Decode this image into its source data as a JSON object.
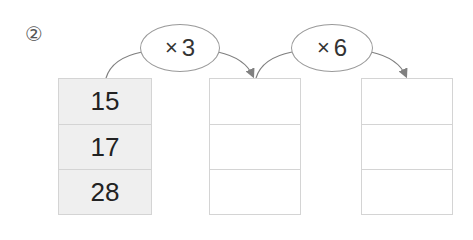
{
  "problem": {
    "number_label": "②"
  },
  "operations": [
    {
      "symbol": "×",
      "operand": "3",
      "label": "×3"
    },
    {
      "symbol": "×",
      "operand": "6",
      "label": "×6"
    }
  ],
  "columns": [
    {
      "name": "input",
      "values": [
        "15",
        "17",
        "28"
      ],
      "filled": true
    },
    {
      "name": "after-x3",
      "values": [
        "",
        "",
        ""
      ],
      "filled": false
    },
    {
      "name": "after-x6",
      "values": [
        "",
        "",
        ""
      ],
      "filled": false
    }
  ],
  "colors": {
    "box_fill": "#efefef",
    "box_border": "#d4d4d4",
    "arrow": "#808080",
    "text": "#222222"
  }
}
